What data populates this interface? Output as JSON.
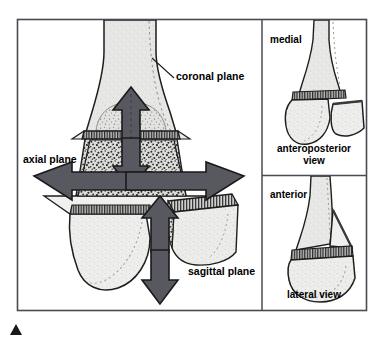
{
  "figure": {
    "type": "anatomical-plane-diagram",
    "frame": {
      "border_color": "#4a4a52",
      "background": "#ffffff",
      "x": 17,
      "y": 19,
      "width": 350,
      "height": 292
    },
    "marker": {
      "name": "corner-triangle-marker",
      "color": "#1a1a1a",
      "x": 10,
      "y": 324,
      "width": 12,
      "height": 11
    }
  },
  "colors": {
    "arrow_fill": "#585860",
    "arrow_stroke": "#1a1a1a",
    "bone_cortex_fill": "#e8e8e6",
    "bone_shaft_fill": "#e3e3e1",
    "cancellous_fill": "#d8d8d6",
    "cut_face_fill": "#efefed",
    "physis_fill": "#9a9a9a",
    "outline": "#1d1d1d",
    "divider": "#4a4a52",
    "text": "#000000"
  },
  "main_panel": {
    "name": "planes-illustration",
    "labels": [
      {
        "id": "coronal",
        "text": "coronal plane",
        "x": 176,
        "y": 80,
        "anchor": "start"
      },
      {
        "id": "axial",
        "text": "axial plane",
        "x": 23,
        "y": 163,
        "anchor": "start"
      },
      {
        "id": "sagittal",
        "text": "sagittal plane",
        "x": 188,
        "y": 275,
        "anchor": "start"
      }
    ],
    "arrows": [
      {
        "id": "coronal-up",
        "direction": "up",
        "plane": "coronal"
      },
      {
        "id": "coronal-down",
        "direction": "down",
        "plane": "coronal"
      },
      {
        "id": "axial-left",
        "direction": "left",
        "plane": "axial"
      },
      {
        "id": "axial-right",
        "direction": "right",
        "plane": "axial"
      },
      {
        "id": "sagittal-up",
        "direction": "up",
        "plane": "sagittal"
      },
      {
        "id": "sagittal-down",
        "direction": "down",
        "plane": "sagittal"
      }
    ]
  },
  "side_panels": [
    {
      "id": "anteroposterior",
      "name": "anteroposterior-view-panel",
      "orientation_label": "medial",
      "caption_line1": "anteroposterior",
      "caption_line2": "view",
      "x": 262,
      "y": 19,
      "width": 105,
      "height": 156
    },
    {
      "id": "lateral",
      "name": "lateral-view-panel",
      "orientation_label": "anterior",
      "caption_line1": "lateral view",
      "caption_line2": "",
      "x": 262,
      "y": 175,
      "width": 105,
      "height": 136
    }
  ]
}
